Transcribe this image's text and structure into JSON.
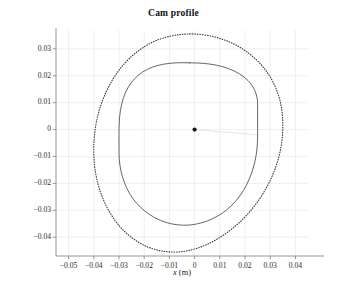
{
  "chart_data": {
    "type": "line",
    "title": "Cam profile",
    "xlabel_italic": "x",
    "xlabel_unit": " (m)",
    "ylabel_italic": "y",
    "ylabel_unit": " (m)",
    "xlim": [
      -0.055,
      0.045
    ],
    "ylim": [
      -0.047,
      0.037
    ],
    "xticks": [
      -0.05,
      -0.04,
      -0.03,
      -0.02,
      -0.01,
      0,
      0.01,
      0.02,
      0.03,
      0.04
    ],
    "xticklabels": [
      "−0.05",
      "−0.04",
      "−0.03",
      "−0.02",
      "−0.01",
      "0",
      "0.01",
      "0.02",
      "0.03",
      "0.04"
    ],
    "yticks": [
      0.03,
      0.02,
      0.01,
      0,
      -0.01,
      -0.02,
      -0.03,
      -0.04
    ],
    "yticklabels": [
      "0.03",
      "0.02",
      "0.01",
      "0",
      "−0.01",
      "−0.02",
      "−0.03",
      "−0.04"
    ],
    "grid": true,
    "grid_color": "#e8e8ea",
    "legend": "none",
    "axis_color": "#8a8a8a",
    "series": [
      {
        "name": "pitch-curve",
        "style": "dotted",
        "color": "#3a3a3a",
        "closed": true,
        "extents": {
          "xmin": -0.04,
          "xmax": 0.035,
          "ymax": 0.0355,
          "ymin": -0.0455
        },
        "center_offset_y": -0.005,
        "points": [
          [
            0.0002,
            0.0355
          ],
          [
            0.0062,
            0.0348
          ],
          [
            0.0118,
            0.0333
          ],
          [
            0.017,
            0.0311
          ],
          [
            0.0218,
            0.0281
          ],
          [
            0.026,
            0.0245
          ],
          [
            0.0295,
            0.0203
          ],
          [
            0.0321,
            0.0157
          ],
          [
            0.0339,
            0.0107
          ],
          [
            0.0348,
            0.0055
          ],
          [
            0.035,
            0.0002
          ],
          [
            0.0345,
            -0.0052
          ],
          [
            0.0333,
            -0.0106
          ],
          [
            0.0314,
            -0.0159
          ],
          [
            0.0288,
            -0.0211
          ],
          [
            0.0256,
            -0.026
          ],
          [
            0.0218,
            -0.0306
          ],
          [
            0.0175,
            -0.0348
          ],
          [
            0.0127,
            -0.0384
          ],
          [
            0.0075,
            -0.0415
          ],
          [
            0.002,
            -0.0438
          ],
          [
            -0.0038,
            -0.0452
          ],
          [
            -0.0096,
            -0.0455
          ],
          [
            -0.0152,
            -0.0447
          ],
          [
            -0.0205,
            -0.0428
          ],
          [
            -0.0253,
            -0.0399
          ],
          [
            -0.0296,
            -0.0361
          ],
          [
            -0.0332,
            -0.0315
          ],
          [
            -0.0361,
            -0.0263
          ],
          [
            -0.0382,
            -0.0207
          ],
          [
            -0.0395,
            -0.0148
          ],
          [
            -0.04,
            -0.0088
          ],
          [
            -0.0398,
            -0.0028
          ],
          [
            -0.0389,
            0.0031
          ],
          [
            -0.0373,
            0.0088
          ],
          [
            -0.035,
            0.0142
          ],
          [
            -0.0321,
            0.0192
          ],
          [
            -0.0286,
            0.0237
          ],
          [
            -0.0245,
            0.0276
          ],
          [
            -0.0199,
            0.0308
          ],
          [
            -0.0149,
            0.0332
          ],
          [
            -0.0096,
            0.0347
          ],
          [
            -0.0047,
            0.0354
          ]
        ]
      },
      {
        "name": "cam-profile",
        "style": "solid",
        "color": "#4a4a4a",
        "closed": true,
        "extents": {
          "xmin": -0.03,
          "xmax": 0.025,
          "ymax": 0.0248,
          "ymin": -0.0355
        },
        "center_offset_y": -0.0053,
        "points": [
          [
            -0.002,
            0.0248
          ],
          [
            0.0035,
            0.0246
          ],
          [
            0.0088,
            0.0239
          ],
          [
            0.0136,
            0.0226
          ],
          [
            0.0178,
            0.0207
          ],
          [
            0.0213,
            0.0181
          ],
          [
            0.0237,
            0.0149
          ],
          [
            0.0249,
            0.0112
          ],
          [
            0.025,
            0.0072
          ],
          [
            0.025,
            0.0028
          ],
          [
            0.025,
            -0.002
          ],
          [
            0.0248,
            -0.0068
          ],
          [
            0.024,
            -0.0116
          ],
          [
            0.0226,
            -0.0162
          ],
          [
            0.0206,
            -0.0206
          ],
          [
            0.018,
            -0.0246
          ],
          [
            0.0148,
            -0.0281
          ],
          [
            0.0111,
            -0.031
          ],
          [
            0.007,
            -0.0332
          ],
          [
            0.0026,
            -0.0347
          ],
          [
            -0.002,
            -0.0355
          ],
          [
            -0.0068,
            -0.0354
          ],
          [
            -0.0114,
            -0.0345
          ],
          [
            -0.0157,
            -0.0328
          ],
          [
            -0.0196,
            -0.0304
          ],
          [
            -0.023,
            -0.0274
          ],
          [
            -0.0258,
            -0.0238
          ],
          [
            -0.0278,
            -0.0198
          ],
          [
            -0.0292,
            -0.0155
          ],
          [
            -0.0299,
            -0.011
          ],
          [
            -0.03,
            -0.0064
          ],
          [
            -0.03,
            -0.0018
          ],
          [
            -0.0299,
            0.0028
          ],
          [
            -0.0294,
            0.0073
          ],
          [
            -0.0283,
            0.0116
          ],
          [
            -0.0265,
            0.0155
          ],
          [
            -0.0239,
            0.0188
          ],
          [
            -0.0206,
            0.0214
          ],
          [
            -0.0167,
            0.0232
          ],
          [
            -0.0123,
            0.0243
          ],
          [
            -0.0073,
            0.0248
          ]
        ]
      }
    ],
    "markers": [
      {
        "name": "center-point",
        "x": 0,
        "y": 0,
        "color": "#1a1a1a",
        "size": 4.2
      }
    ],
    "annotations": [
      {
        "name": "radius-line",
        "from": [
          0,
          0
        ],
        "to": [
          0.025,
          -0.002
        ],
        "color": "#d8d8d8"
      }
    ]
  }
}
